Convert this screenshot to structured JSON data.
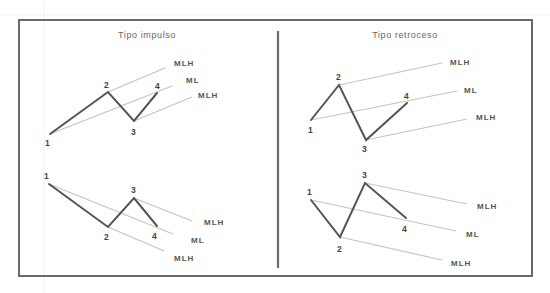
{
  "diagram": {
    "panels": [
      {
        "id": "impulse",
        "title": "Tipo impulso",
        "charts": [
          {
            "id": "impulse-up",
            "points": [
              {
                "label": "1"
              },
              {
                "label": "2"
              },
              {
                "label": "3"
              },
              {
                "label": "4"
              }
            ],
            "lines": [
              {
                "label": "MLH",
                "role": "upper-median-line-parallel",
                "from_point": "2"
              },
              {
                "label": "ML",
                "role": "median-line",
                "from_point": "1"
              },
              {
                "label": "MLH",
                "role": "lower-median-line-parallel",
                "from_point": "3"
              }
            ]
          },
          {
            "id": "impulse-down",
            "points": [
              {
                "label": "1"
              },
              {
                "label": "2"
              },
              {
                "label": "3"
              },
              {
                "label": "4"
              }
            ],
            "lines": [
              {
                "label": "MLH",
                "role": "upper-median-line-parallel",
                "from_point": "3"
              },
              {
                "label": "ML",
                "role": "median-line",
                "from_point": "1"
              },
              {
                "label": "MLH",
                "role": "lower-median-line-parallel",
                "from_point": "2"
              }
            ]
          }
        ]
      },
      {
        "id": "retracement",
        "title": "Tipo retroceso",
        "charts": [
          {
            "id": "retracement-up",
            "points": [
              {
                "label": "1"
              },
              {
                "label": "2"
              },
              {
                "label": "3"
              },
              {
                "label": "4"
              }
            ],
            "lines": [
              {
                "label": "MLH",
                "role": "upper-median-line-parallel",
                "from_point": "2"
              },
              {
                "label": "ML",
                "role": "median-line",
                "from_point": "1"
              },
              {
                "label": "MLH",
                "role": "lower-median-line-parallel",
                "from_point": "3"
              }
            ]
          },
          {
            "id": "retracement-down",
            "points": [
              {
                "label": "1"
              },
              {
                "label": "2"
              },
              {
                "label": "3"
              },
              {
                "label": "4"
              }
            ],
            "lines": [
              {
                "label": "MLH",
                "role": "upper-median-line-parallel",
                "from_point": "3"
              },
              {
                "label": "ML",
                "role": "median-line",
                "from_point": "1"
              },
              {
                "label": "MLH",
                "role": "lower-median-line-parallel",
                "from_point": "2"
              }
            ]
          }
        ]
      }
    ]
  }
}
